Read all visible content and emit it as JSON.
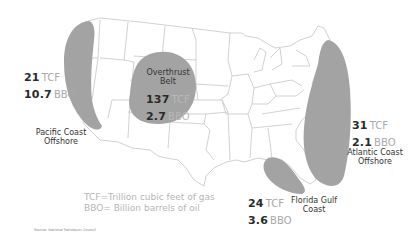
{
  "map": {
    "subject": "US natural gas and oil resource areas",
    "region_fill": "#a3a3a3",
    "state_line_color": "#c4c4c4",
    "regions": [
      {
        "id": "pacific",
        "name_line1": "Pacific Coast",
        "name_line2": "Offshore",
        "gas_value": "21",
        "gas_unit": "TCF",
        "oil_value": "10.7",
        "oil_unit": "BBO"
      },
      {
        "id": "overthrust",
        "name_line1": "Overthrust",
        "name_line2": "Belt",
        "gas_value": "137",
        "gas_unit": "TCF",
        "oil_value": "2.7",
        "oil_unit": "BBO"
      },
      {
        "id": "gulf",
        "name_line1": "Florida Gulf",
        "name_line2": "Coast",
        "gas_value": "24",
        "gas_unit": "TCF",
        "oil_value": "3.6",
        "oil_unit": "BBO"
      },
      {
        "id": "atlantic",
        "name_line1": "Atlantic Coast",
        "name_line2": "Offshore",
        "gas_value": "31",
        "gas_unit": "TCF",
        "oil_value": "2.1",
        "oil_unit": "BBO"
      }
    ],
    "legend": {
      "line1": "TCF=Trillion cubic feet of gas",
      "line2": "BBO= Billion barrels of oil"
    },
    "source": "Source: National Petroleum Council"
  }
}
